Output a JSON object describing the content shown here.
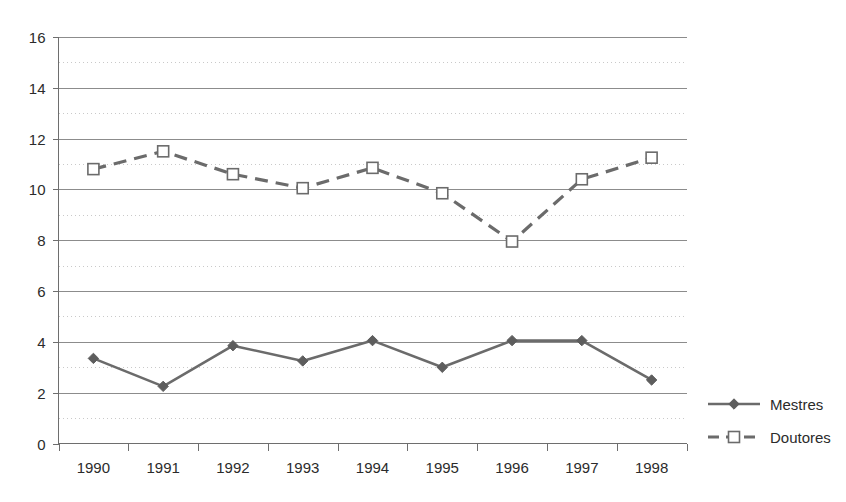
{
  "chart_data": {
    "type": "line",
    "title": "",
    "xlabel": "",
    "ylabel": "",
    "categories": [
      "1990",
      "1991",
      "1992",
      "1993",
      "1994",
      "1995",
      "1996",
      "1997",
      "1998"
    ],
    "series": [
      {
        "name": "Mestres",
        "marker": "filled-diamond",
        "linestyle": "solid",
        "color": "#6b6b6b",
        "values": [
          3.35,
          2.25,
          3.85,
          3.25,
          4.05,
          3.0,
          4.05,
          4.05,
          2.5
        ]
      },
      {
        "name": "Doutores",
        "marker": "open-square",
        "linestyle": "dashed",
        "color": "#6b6b6b",
        "values": [
          10.8,
          11.5,
          10.6,
          10.05,
          10.85,
          9.85,
          7.95,
          10.4,
          11.25
        ]
      }
    ],
    "ylim": [
      0,
      16
    ],
    "y_ticks": [
      "0",
      "2",
      "4",
      "6",
      "8",
      "10",
      "12",
      "14",
      "16"
    ],
    "y_tick_values": [
      0,
      2,
      4,
      6,
      8,
      10,
      12,
      14,
      16
    ],
    "y_minor_values": [
      1,
      3,
      5,
      7,
      9,
      11,
      13,
      15
    ],
    "grid": "major-solid-minor-dotted",
    "legend_position": "right",
    "legend": [
      {
        "label": "Mestres",
        "marker": "filled-diamond",
        "linestyle": "solid"
      },
      {
        "label": "Doutores",
        "marker": "open-square",
        "linestyle": "dashed"
      }
    ]
  }
}
